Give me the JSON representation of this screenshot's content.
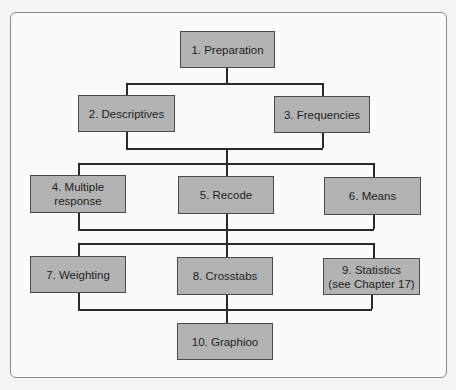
{
  "diagram": {
    "type": "flowchart",
    "nodes": [
      {
        "id": 1,
        "label": "1. Preparation"
      },
      {
        "id": 2,
        "label": "2. Descriptives"
      },
      {
        "id": 3,
        "label": "3. Frequencies"
      },
      {
        "id": 4,
        "label_line1": "4. Multiple",
        "label_line2": "response"
      },
      {
        "id": 5,
        "label": "5. Recode"
      },
      {
        "id": 6,
        "label": "6. Means"
      },
      {
        "id": 7,
        "label": "7. Weighting"
      },
      {
        "id": 8,
        "label": "8. Crosstabs"
      },
      {
        "id": 9,
        "label_line1": "9. Statistics",
        "label_line2": "(see Chapter 17)"
      },
      {
        "id": 10,
        "label": "10. Graphioo"
      }
    ],
    "edges": [
      [
        "1",
        "2"
      ],
      [
        "1",
        "3"
      ],
      [
        "2",
        "4"
      ],
      [
        "2",
        "5"
      ],
      [
        "2",
        "6"
      ],
      [
        "3",
        "4"
      ],
      [
        "3",
        "5"
      ],
      [
        "3",
        "6"
      ],
      [
        "4",
        "7"
      ],
      [
        "4",
        "8"
      ],
      [
        "4",
        "9"
      ],
      [
        "5",
        "7"
      ],
      [
        "5",
        "8"
      ],
      [
        "5",
        "9"
      ],
      [
        "6",
        "7"
      ],
      [
        "6",
        "8"
      ],
      [
        "6",
        "9"
      ],
      [
        "7",
        "10"
      ],
      [
        "8",
        "10"
      ],
      [
        "9",
        "10"
      ]
    ],
    "colors": {
      "box_fill": "#b3b3b3",
      "box_border": "#4a4a4a",
      "line": "#2a2a2a",
      "frame": "#8a8a8a"
    }
  }
}
